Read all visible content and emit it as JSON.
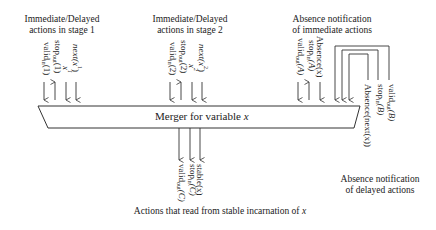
{
  "diagram": {
    "merger": {
      "label": "Merger for variable ",
      "var": "x"
    },
    "groups": {
      "stage1": {
        "caption_line1": "Immediate/Delayed",
        "caption_line2": "actions in stage 1",
        "signals": [
          {
            "label": "valid",
            "sub": "in",
            "arg": "(1)",
            "direction": "down"
          },
          {
            "label": "stop",
            "sub": "out",
            "arg": "(1)",
            "direction": "up"
          },
          {
            "label": "x",
            "sup": "1",
            "direction": "down"
          },
          {
            "label": "next(x",
            "sup": "1",
            "tail": ")",
            "direction": "down"
          }
        ]
      },
      "stage2": {
        "caption_line1": "Immediate/Delayed",
        "caption_line2": "actions in stage 2",
        "signals": [
          {
            "label": "valid",
            "sub": "in",
            "arg": "(2)",
            "direction": "down"
          },
          {
            "label": "stop",
            "sub": "out",
            "arg": "(2)",
            "direction": "up"
          },
          {
            "label": "x",
            "sup": "2",
            "direction": "down"
          },
          {
            "label": "next(x",
            "sup": "2",
            "tail": ")",
            "direction": "down"
          }
        ]
      },
      "absence_immediate": {
        "caption_line1": "Absence notification",
        "caption_line2": "of immediate actions",
        "signals": [
          {
            "label": "valid",
            "sub": "out",
            "arg": "(A)",
            "direction": "down"
          },
          {
            "label": "stop",
            "sub": "in",
            "arg": "(A)",
            "direction": "up"
          },
          {
            "label": "Absence(x)",
            "direction": "down"
          }
        ]
      },
      "absence_delayed": {
        "caption_line1": "Absence notification",
        "caption_line2": "of delayed actions",
        "signals": [
          {
            "label": "valid",
            "sub": "out",
            "arg": "(B)",
            "direction": "down"
          },
          {
            "label": "stop",
            "sub": "in",
            "arg": "(B)",
            "direction": "down"
          },
          {
            "label": "Absence(next(x))",
            "direction": "down"
          }
        ]
      },
      "stable_readers": {
        "caption": "Actions that read from stable incarnation of ",
        "caption_var": "x",
        "signals": [
          {
            "label": "valid",
            "sub": "out",
            "arg": "(C)",
            "direction": "down"
          },
          {
            "label": "stop",
            "sub": "in",
            "arg": "(C)",
            "direction": "up"
          },
          {
            "label": "stable(x)",
            "direction": "up"
          }
        ]
      }
    }
  }
}
